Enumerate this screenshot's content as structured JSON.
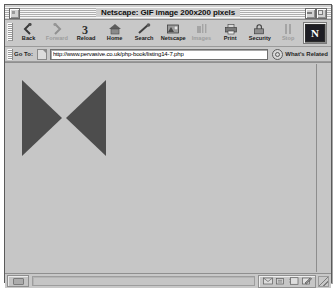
{
  "window": {
    "title": "Netscape: GIF image 200x200 pixels",
    "close_box": "close-box",
    "collapse_box": "collapse-box",
    "zoom_box": "zoom-box"
  },
  "toolbar": {
    "buttons": [
      {
        "label": "Back",
        "icon": "back-icon",
        "disabled": false
      },
      {
        "label": "Forward",
        "icon": "forward-icon",
        "disabled": true
      },
      {
        "label": "Reload",
        "icon": "reload-icon",
        "disabled": false
      },
      {
        "label": "Home",
        "icon": "home-icon",
        "disabled": false
      },
      {
        "label": "Search",
        "icon": "search-icon",
        "disabled": false
      },
      {
        "label": "Netscape",
        "icon": "netscape-icon",
        "disabled": false
      },
      {
        "label": "Images",
        "icon": "images-icon",
        "disabled": true
      },
      {
        "label": "Print",
        "icon": "print-icon",
        "disabled": false
      },
      {
        "label": "Security",
        "icon": "security-icon",
        "disabled": false
      },
      {
        "label": "Stop",
        "icon": "stop-icon",
        "disabled": true
      }
    ],
    "logo_letter": "N"
  },
  "location_bar": {
    "goto_label": "Go To:",
    "url": "http://www.pervasive.co.uk/php-book/listing14-7.php",
    "placeholder": "Enter a URL",
    "related_label": "What's Related"
  },
  "content": {
    "image_alt": "GIF image 200x200 pixels",
    "shape": "bowtie",
    "shape_color": "#4d4d4d",
    "background_color": "#c6c6c6"
  },
  "status_bar": {
    "status_text": "",
    "security_icon": "padlock-icon",
    "components": [
      {
        "icon": "mail-icon"
      },
      {
        "icon": "newsgroup-icon"
      },
      {
        "icon": "addressbook-icon"
      },
      {
        "icon": "composer-icon"
      }
    ]
  }
}
